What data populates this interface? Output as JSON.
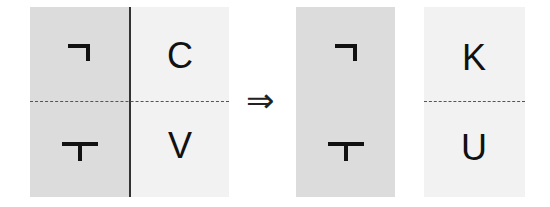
{
  "diagram": {
    "left_group": {
      "top_left_glyph": "ㄱ",
      "top_right_letter": "C",
      "bottom_left_glyph": "ㅜ",
      "bottom_right_letter": "V"
    },
    "arrow": "⇒",
    "middle_panel": {
      "top_glyph": "ㄱ",
      "bottom_glyph": "ㅜ"
    },
    "right_panel": {
      "top_letter": "K",
      "bottom_letter": "U"
    },
    "colors": {
      "gray_fill": "#dcdcdc",
      "light_fill": "#f2f2f2",
      "stroke": "#111111"
    }
  }
}
